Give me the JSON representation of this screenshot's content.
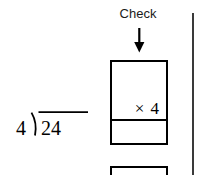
{
  "worksheet": {
    "background_color": "#ffffff",
    "ink_color": "#000000",
    "check_label": "Check",
    "arrow_icon": "arrow-down-icon",
    "division": {
      "divisor": "4",
      "dividend": "24",
      "notation": "long-division-bracket",
      "expression": "4)24"
    },
    "multiplication_box": {
      "operator_line": "× 4",
      "operator": "×",
      "factor": "4",
      "product_value": "",
      "cells": 2
    },
    "second_box": {
      "value": ""
    },
    "divider": {
      "name": "page-divider-rule",
      "color": "#3a3a3a"
    }
  }
}
